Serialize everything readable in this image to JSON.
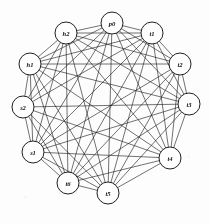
{
  "figure": {
    "type": "graph-diagram",
    "title": "",
    "layout": "circular",
    "background_color": "#ffffff",
    "node_fill": "#ffffff",
    "node_stroke": "#141414",
    "edge_color": "#1a1a1a",
    "node_radius": 11
  },
  "chart_data": {
    "type": "diagram",
    "title": "",
    "layout": "circular",
    "nodes": [
      {
        "id": "p0",
        "label": "p0",
        "x": 112,
        "y": 23
      },
      {
        "id": "t1",
        "label": "t1",
        "x": 152,
        "y": 33
      },
      {
        "id": "t2",
        "label": "t2",
        "x": 180,
        "y": 64
      },
      {
        "id": "t3",
        "label": "t3",
        "x": 189,
        "y": 104
      },
      {
        "id": "t4",
        "label": "t4",
        "x": 170,
        "y": 158
      },
      {
        "id": "t5",
        "label": "t5",
        "x": 108,
        "y": 193
      },
      {
        "id": "t6",
        "label": "t6",
        "x": 68,
        "y": 183
      },
      {
        "id": "s1",
        "label": "s1",
        "x": 33,
        "y": 152
      },
      {
        "id": "s2",
        "label": "s2",
        "x": 23,
        "y": 107
      },
      {
        "id": "h1",
        "label": "h1",
        "x": 30,
        "y": 64
      },
      {
        "id": "h2",
        "label": "h2",
        "x": 66,
        "y": 33
      }
    ],
    "edges": [
      [
        "p0",
        "t1"
      ],
      [
        "p0",
        "t2"
      ],
      [
        "p0",
        "t3"
      ],
      [
        "p0",
        "t4"
      ],
      [
        "p0",
        "t5"
      ],
      [
        "p0",
        "t6"
      ],
      [
        "p0",
        "s1"
      ],
      [
        "p0",
        "s2"
      ],
      [
        "p0",
        "h1"
      ],
      [
        "p0",
        "h2"
      ],
      [
        "t1",
        "t2"
      ],
      [
        "t1",
        "t3"
      ],
      [
        "t1",
        "t4"
      ],
      [
        "t1",
        "t5"
      ],
      [
        "t1",
        "t6"
      ],
      [
        "t1",
        "s1"
      ],
      [
        "t1",
        "s2"
      ],
      [
        "t1",
        "h1"
      ],
      [
        "t1",
        "h2"
      ],
      [
        "t2",
        "t3"
      ],
      [
        "t2",
        "t4"
      ],
      [
        "t2",
        "t5"
      ],
      [
        "t2",
        "t6"
      ],
      [
        "t2",
        "s1"
      ],
      [
        "t2",
        "h1"
      ],
      [
        "t2",
        "h2"
      ],
      [
        "t3",
        "t4"
      ],
      [
        "t3",
        "t5"
      ],
      [
        "t3",
        "t6"
      ],
      [
        "t3",
        "s1"
      ],
      [
        "t3",
        "s2"
      ],
      [
        "t3",
        "h1"
      ],
      [
        "t3",
        "h2"
      ],
      [
        "t4",
        "t5"
      ],
      [
        "t4",
        "t6"
      ],
      [
        "t4",
        "s1"
      ],
      [
        "t4",
        "s2"
      ],
      [
        "t4",
        "h1"
      ],
      [
        "t4",
        "h2"
      ],
      [
        "t5",
        "t6"
      ],
      [
        "t5",
        "s1"
      ],
      [
        "t5",
        "s2"
      ],
      [
        "t5",
        "h1"
      ],
      [
        "t5",
        "h2"
      ],
      [
        "t6",
        "s1"
      ],
      [
        "t6",
        "s2"
      ],
      [
        "t6",
        "h1"
      ],
      [
        "t6",
        "h2"
      ],
      [
        "s1",
        "s2"
      ],
      [
        "s1",
        "h1"
      ],
      [
        "s1",
        "h2"
      ],
      [
        "s2",
        "h1"
      ],
      [
        "s2",
        "h2"
      ],
      [
        "h1",
        "h2"
      ]
    ],
    "node_count": 11,
    "edge_count": 55,
    "directed": false,
    "xlabel": "",
    "ylabel": ""
  }
}
